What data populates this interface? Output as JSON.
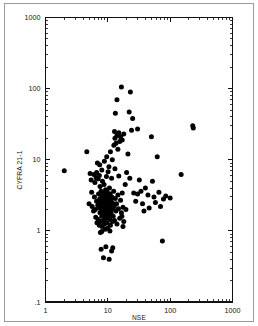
{
  "chart_data": {
    "type": "scatter",
    "title": "",
    "xlabel": "NSE",
    "ylabel": "CYFRA 21-1",
    "xscale": "log",
    "yscale": "log",
    "xlim": [
      1,
      1000
    ],
    "ylim": [
      0.1,
      1000
    ],
    "xticks": [
      1,
      10,
      100,
      1000
    ],
    "xtick_labels": [
      "1",
      "10",
      "100",
      "1000"
    ],
    "yticks": [
      0.1,
      1,
      10,
      100,
      1000
    ],
    "ytick_labels": [
      ".1",
      "1",
      "10",
      "100",
      "1000"
    ],
    "grid": false,
    "legend": false,
    "marker": "filled-circle",
    "marker_color": "#000000",
    "n_points": 168,
    "points": [
      [
        2.0,
        7.0
      ],
      [
        4.6,
        13.0
      ],
      [
        5.2,
        6.4
      ],
      [
        5.4,
        5.2
      ],
      [
        5.6,
        2.2
      ],
      [
        5.9,
        1.9
      ],
      [
        6.0,
        6.2
      ],
      [
        6.1,
        3.0
      ],
      [
        6.3,
        2.0
      ],
      [
        6.4,
        1.55
      ],
      [
        6.5,
        5.6
      ],
      [
        6.6,
        2.6
      ],
      [
        6.7,
        1.3
      ],
      [
        6.8,
        9.0
      ],
      [
        6.9,
        2.3
      ],
      [
        7.0,
        1.45
      ],
      [
        7.0,
        5.4
      ],
      [
        7.1,
        3.3
      ],
      [
        7.2,
        2.1
      ],
      [
        7.3,
        1.2
      ],
      [
        7.3,
        6.0
      ],
      [
        7.4,
        2.8
      ],
      [
        7.5,
        1.8
      ],
      [
        7.5,
        4.2
      ],
      [
        7.6,
        2.45
      ],
      [
        7.7,
        1.35
      ],
      [
        7.8,
        3.6
      ],
      [
        7.8,
        0.55
      ],
      [
        7.9,
        2.05
      ],
      [
        8.0,
        1.6
      ],
      [
        8.0,
        3.1
      ],
      [
        8.1,
        2.7
      ],
      [
        8.1,
        1.15
      ],
      [
        8.2,
        5.0
      ],
      [
        8.2,
        2.25
      ],
      [
        8.3,
        1.75
      ],
      [
        8.4,
        3.4
      ],
      [
        8.4,
        2.55
      ],
      [
        8.5,
        1.4
      ],
      [
        8.5,
        0.42
      ],
      [
        8.6,
        2.9
      ],
      [
        8.6,
        1.95
      ],
      [
        8.7,
        4.5
      ],
      [
        8.7,
        2.35
      ],
      [
        8.8,
        1.25
      ],
      [
        8.9,
        3.2
      ],
      [
        8.9,
        2.15
      ],
      [
        9.0,
        1.65
      ],
      [
        9.0,
        2.75
      ],
      [
        9.1,
        1.05
      ],
      [
        9.2,
        3.8
      ],
      [
        9.2,
        2.4
      ],
      [
        9.3,
        1.85
      ],
      [
        9.4,
        2.6
      ],
      [
        9.4,
        1.5
      ],
      [
        9.5,
        5.8
      ],
      [
        9.5,
        2.95
      ],
      [
        9.6,
        2.0
      ],
      [
        9.7,
        1.3
      ],
      [
        9.8,
        3.5
      ],
      [
        9.8,
        2.3
      ],
      [
        9.9,
        1.7
      ],
      [
        10.0,
        2.5
      ],
      [
        10.0,
        1.1
      ],
      [
        10.1,
        6.8
      ],
      [
        10.2,
        3.05
      ],
      [
        10.2,
        2.2
      ],
      [
        10.3,
        1.6
      ],
      [
        10.4,
        2.8
      ],
      [
        10.5,
        1.9
      ],
      [
        10.5,
        0.4
      ],
      [
        10.6,
        4.0
      ],
      [
        10.7,
        2.35
      ],
      [
        10.8,
        1.45
      ],
      [
        10.9,
        3.3
      ],
      [
        11.0,
        2.1
      ],
      [
        11.0,
        1.2
      ],
      [
        11.2,
        2.65
      ],
      [
        11.3,
        1.75
      ],
      [
        11.5,
        5.5
      ],
      [
        11.6,
        3.0
      ],
      [
        11.7,
        2.0
      ],
      [
        11.9,
        1.35
      ],
      [
        12.0,
        2.45
      ],
      [
        12.2,
        1.6
      ],
      [
        12.4,
        3.6
      ],
      [
        12.6,
        2.2
      ],
      [
        12.8,
        1.4
      ],
      [
        13.0,
        7.5
      ],
      [
        13.2,
        2.85
      ],
      [
        13.5,
        1.9
      ],
      [
        13.8,
        2.4
      ],
      [
        14.0,
        1.25
      ],
      [
        14.5,
        3.2
      ],
      [
        14.8,
        2.05
      ],
      [
        15.0,
        5.9
      ],
      [
        15.5,
        1.5
      ],
      [
        16.0,
        2.7
      ],
      [
        16.5,
        1.8
      ],
      [
        17.0,
        3.4
      ],
      [
        17.5,
        2.15
      ],
      [
        18.0,
        1.35
      ],
      [
        5.0,
        2.4
      ],
      [
        5.5,
        3.5
      ],
      [
        6.2,
        4.8
      ],
      [
        6.6,
        6.6
      ],
      [
        7.4,
        8.5
      ],
      [
        8.0,
        7.2
      ],
      [
        8.8,
        9.5
      ],
      [
        9.6,
        11.0
      ],
      [
        10.4,
        8.0
      ],
      [
        11.0,
        13.0
      ],
      [
        11.8,
        10.0
      ],
      [
        12.5,
        16.0
      ],
      [
        13.0,
        20.0
      ],
      [
        13.5,
        17.0
      ],
      [
        14.0,
        22.0
      ],
      [
        14.5,
        14.0
      ],
      [
        15.0,
        24.0
      ],
      [
        15.5,
        18.0
      ],
      [
        16.0,
        21.0
      ],
      [
        17.0,
        19.0
      ],
      [
        18.0,
        23.0
      ],
      [
        12.8,
        25.0
      ],
      [
        13.2,
        45.0
      ],
      [
        14.0,
        70.0
      ],
      [
        16.5,
        105.0
      ],
      [
        23.0,
        90.0
      ],
      [
        22.0,
        47.0
      ],
      [
        25.0,
        38.0
      ],
      [
        24.0,
        26.0
      ],
      [
        30.0,
        27.0
      ],
      [
        21.0,
        12.0
      ],
      [
        20.0,
        6.6
      ],
      [
        22.5,
        5.5
      ],
      [
        26.0,
        3.4
      ],
      [
        28.0,
        2.6
      ],
      [
        30.0,
        3.3
      ],
      [
        32.0,
        5.2
      ],
      [
        34.0,
        3.6
      ],
      [
        36.0,
        2.4
      ],
      [
        38.0,
        1.9
      ],
      [
        40.0,
        4.0
      ],
      [
        44.0,
        3.2
      ],
      [
        46.0,
        2.1
      ],
      [
        50.0,
        21.0
      ],
      [
        52.0,
        5.0
      ],
      [
        55.0,
        3.0
      ],
      [
        58.0,
        2.5
      ],
      [
        62.0,
        11.0
      ],
      [
        66.0,
        3.5
      ],
      [
        70.0,
        2.2
      ],
      [
        75.0,
        0.72
      ],
      [
        78.0,
        2.8
      ],
      [
        85.0,
        3.1
      ],
      [
        100.0,
        2.9
      ],
      [
        150.0,
        6.2
      ],
      [
        230.0,
        30.0
      ],
      [
        235.0,
        28.0
      ],
      [
        19.0,
        4.5
      ],
      [
        19.5,
        2.0
      ],
      [
        17.5,
        1.15
      ],
      [
        16.8,
        1.6
      ],
      [
        12.0,
        0.58
      ],
      [
        11.5,
        0.52
      ],
      [
        9.3,
        0.6
      ],
      [
        8.0,
        0.98
      ],
      [
        10.8,
        1.0
      ],
      [
        7.6,
        0.95
      ]
    ]
  },
  "axes": {
    "y_title": "CYFRA 21-1",
    "x_title": "NSE"
  }
}
